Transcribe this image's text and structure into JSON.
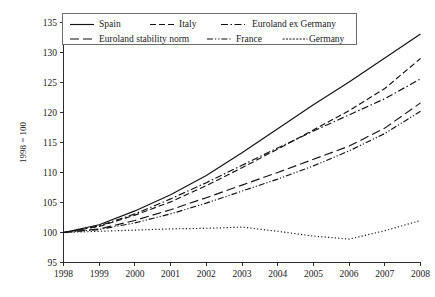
{
  "chart_data": {
    "type": "line",
    "title": "",
    "subtitle": "",
    "xlabel": "",
    "ylabel": "1998 = 100",
    "x": [
      1998,
      1999,
      2000,
      2001,
      2002,
      2003,
      2004,
      2005,
      2006,
      2007,
      2008
    ],
    "xlim": [
      1998,
      2008
    ],
    "ylim": [
      95,
      135
    ],
    "ytick_values": [
      95,
      100,
      105,
      110,
      115,
      120,
      125,
      130,
      135
    ],
    "ytick_labels": [
      "95",
      "100",
      "105",
      "110",
      "115",
      "120",
      "125",
      "130",
      "135"
    ],
    "xtick_labels": [
      "1998",
      "1999",
      "2000",
      "2001",
      "2002",
      "2003",
      "2004",
      "2005",
      "2006",
      "2007",
      "2008"
    ],
    "grid": false,
    "legend_position": "top",
    "legend_columns": 3,
    "series": [
      {
        "name": "Spain",
        "dash": "none",
        "dasharray": "",
        "values": [
          100.0,
          101.3,
          103.6,
          106.3,
          109.5,
          113.3,
          117.3,
          121.3,
          125.1,
          129.1,
          133.1
        ]
      },
      {
        "name": "Italy",
        "dash": "dashed",
        "dasharray": "6,3",
        "values": [
          100.0,
          101.0,
          102.9,
          105.1,
          107.8,
          110.8,
          113.9,
          117.1,
          120.3,
          124.0,
          129.0
        ]
      },
      {
        "name": "Euroland ex Germany",
        "dash": "dash-dot",
        "dasharray": "7,2.5,1.5,2.5",
        "values": [
          100.0,
          101.1,
          103.1,
          105.6,
          108.3,
          111.2,
          114.1,
          116.9,
          119.6,
          122.3,
          125.6
        ]
      },
      {
        "name": "Euroland stability norm",
        "dash": "long-dash",
        "dasharray": "9,4",
        "values": [
          100.0,
          100.6,
          102.0,
          103.8,
          105.8,
          107.9,
          110.0,
          112.2,
          114.4,
          117.4,
          121.6
        ]
      },
      {
        "name": "France",
        "dash": "dash-dot-dot",
        "dasharray": "6,2,1.2,2,1.2,2",
        "values": [
          100.0,
          100.5,
          101.6,
          103.1,
          104.9,
          106.9,
          108.9,
          111.1,
          113.6,
          116.5,
          120.2
        ]
      },
      {
        "name": "Germany",
        "dash": "dotted",
        "dasharray": "1.2,2.2",
        "values": [
          100.0,
          100.2,
          100.4,
          100.6,
          100.7,
          100.9,
          100.2,
          99.4,
          98.9,
          100.3,
          102.0
        ]
      }
    ]
  },
  "axis": {
    "y_title": "1998 = 100"
  },
  "legend": {
    "entries": [
      {
        "label": "Spain"
      },
      {
        "label": "Italy"
      },
      {
        "label": "Euroland ex Germany"
      },
      {
        "label": "Euroland stability norm"
      },
      {
        "label": "France"
      },
      {
        "label": "Germany"
      }
    ]
  },
  "colors": {
    "line": "#111111",
    "axis": "#2b2b2b",
    "legend_border": "#6d6d6d",
    "background": "#ffffff"
  }
}
